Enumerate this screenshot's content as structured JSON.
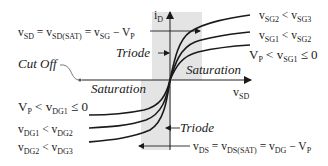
{
  "diagram": {
    "colors": {
      "curve": "#1a1a1a",
      "shade": "#e6e6e6",
      "axis": "#222222"
    },
    "axes": {
      "y_label_main": "i",
      "y_label_sub": "D",
      "x_label_main": "v",
      "x_label_sub": "SD"
    },
    "regions": {
      "triode_top": "Triode",
      "triode_bottom": "Triode",
      "saturation_right": "Saturation",
      "saturation_left": "Saturation",
      "cut_off": "Cut Off"
    },
    "equations": {
      "top": {
        "v1": "v",
        "s1": "SD",
        "eq1": " = ",
        "v2": "v",
        "s2": "SD(SAT)",
        "eq2": " = ",
        "v3": "v",
        "s3": "SG",
        "minus": " − ",
        "v4": "V",
        "s4": "P"
      },
      "bottom": {
        "v1": "v",
        "s1": "DS",
        "eq1": " = ",
        "v2": "v",
        "s2": "DS(SAT)",
        "eq2": " = ",
        "v3": "v",
        "s3": "DG",
        "minus": " − ",
        "v4": "V",
        "s4": "P"
      }
    },
    "curve_labels_right": [
      {
        "a": "v",
        "as": "SG2",
        "op": " < ",
        "b": "v",
        "bs": "SG3",
        "tail": ""
      },
      {
        "a": "v",
        "as": "SG1",
        "op": " < ",
        "b": "v",
        "bs": "SG2",
        "tail": ""
      },
      {
        "a": "V",
        "as": "P",
        "op": " < ",
        "b": "v",
        "bs": "SG1",
        "tail": " ≤ 0"
      }
    ],
    "curve_labels_left": [
      {
        "a": "V",
        "as": "P",
        "op": " < ",
        "b": "v",
        "bs": "DG1",
        "tail": " ≤ 0"
      },
      {
        "a": "v",
        "as": "DG1",
        "op": " < ",
        "b": "v",
        "bs": "DG2",
        "tail": ""
      },
      {
        "a": "v",
        "as": "DG2",
        "op": " < ",
        "b": "v",
        "bs": "DG3",
        "tail": ""
      }
    ]
  }
}
